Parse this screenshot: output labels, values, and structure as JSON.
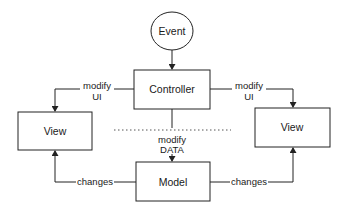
{
  "diagram": {
    "type": "flowchart",
    "title": "",
    "nodes": {
      "event": {
        "label": "Event",
        "shape": "ellipse"
      },
      "controller": {
        "label": "Controller",
        "shape": "rectangle"
      },
      "view_left": {
        "label": "View",
        "shape": "rectangle"
      },
      "view_right": {
        "label": "View",
        "shape": "rectangle"
      },
      "model": {
        "label": "Model",
        "shape": "rectangle"
      }
    },
    "edges": {
      "event_controller": {
        "from": "Event",
        "to": "Controller",
        "label": ""
      },
      "controller_view_left": {
        "from": "Controller",
        "to": "View (left)",
        "label_line1": "modify",
        "label_line2": "UI"
      },
      "controller_view_right": {
        "from": "Controller",
        "to": "View (right)",
        "label_line1": "modify",
        "label_line2": "UI"
      },
      "controller_model": {
        "from": "Controller",
        "to": "Model",
        "label_line1": "modify",
        "label_line2": "DATA"
      },
      "model_view_left": {
        "from": "Model",
        "to": "View (left)",
        "label": "changes"
      },
      "model_view_right": {
        "from": "Model",
        "to": "View (right)",
        "label": "changes"
      }
    },
    "separator": {
      "style": "dotted",
      "orientation": "horizontal"
    }
  }
}
